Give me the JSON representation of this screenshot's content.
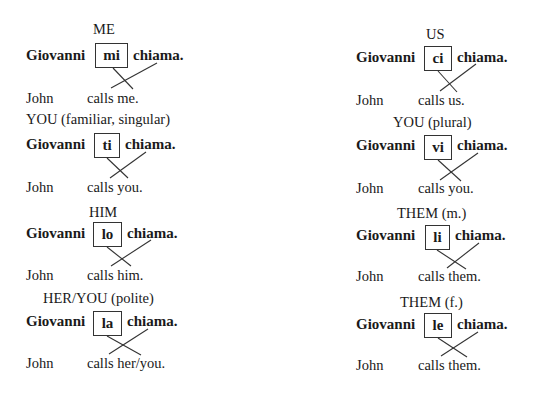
{
  "blocks": [
    {
      "label": "ME",
      "subject": "Giovanni",
      "pronoun": "mi",
      "verb": "chiama.",
      "en_subject": "John",
      "en_verb": "calls me."
    },
    {
      "label": "YOU (familiar, singular)",
      "subject": "Giovanni",
      "pronoun": "ti",
      "verb": "chiama.",
      "en_subject": "John",
      "en_verb": "calls you."
    },
    {
      "label": "HIM",
      "subject": "Giovanni",
      "pronoun": "lo",
      "verb": "chiama.",
      "en_subject": "John",
      "en_verb": "calls him."
    },
    {
      "label": "HER/YOU (polite)",
      "subject": "Giovanni",
      "pronoun": "la",
      "verb": "chiama.",
      "en_subject": "John",
      "en_verb": "calls her/you."
    },
    {
      "label": "US",
      "subject": "Giovanni",
      "pronoun": "ci",
      "verb": "chiama.",
      "en_subject": "John",
      "en_verb": "calls us."
    },
    {
      "label": "YOU (plural)",
      "subject": "Giovanni",
      "pronoun": "vi",
      "verb": "chiama.",
      "en_subject": "John",
      "en_verb": "calls you."
    },
    {
      "label": "THEM (m.)",
      "subject": "Giovanni",
      "pronoun": "li",
      "verb": "chiama.",
      "en_subject": "John",
      "en_verb": "calls them."
    },
    {
      "label": "THEM (f.)",
      "subject": "Giovanni",
      "pronoun": "le",
      "verb": "chiama.",
      "en_subject": "John",
      "en_verb": "calls them."
    }
  ]
}
